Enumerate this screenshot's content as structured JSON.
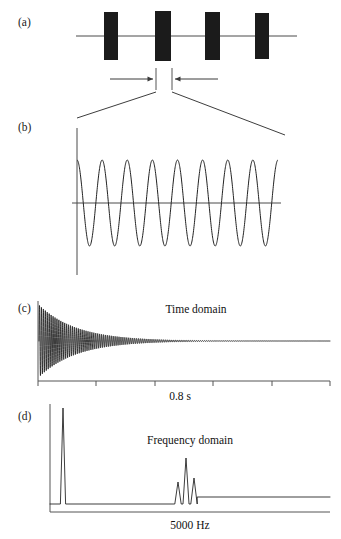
{
  "figure": {
    "caption_panels": [
      "(a)",
      "(b)",
      "(c)",
      "(d)"
    ],
    "label_a": "(a)",
    "label_b": "(b)",
    "label_c": "(c)",
    "label_d": "(d)",
    "background_color": "#ffffff",
    "ink_color": "#1a1a1a"
  },
  "panel_a": {
    "name": "pulse-train",
    "description": "Repeating dark pulse packets on a horizontal baseline",
    "baseline_y": 36,
    "baseline_x_start": 76,
    "baseline_x_end": 297,
    "pulse_color": "#1b1b1b",
    "pulses": [
      {
        "x": 104,
        "y": 12,
        "width": 14,
        "height": 48
      },
      {
        "x": 155,
        "y": 11,
        "width": 16,
        "height": 50
      },
      {
        "x": 205,
        "y": 12,
        "width": 15,
        "height": 48
      },
      {
        "x": 255,
        "y": 13,
        "width": 14,
        "height": 46
      }
    ],
    "markers": {
      "left_tick_x": 156,
      "right_tick_x": 172,
      "tick_top_y": 68,
      "tick_bottom_y": 90
    },
    "arrows": [
      {
        "from_x": 110,
        "to_x": 153,
        "y": 79,
        "direction": "right"
      },
      {
        "from_x": 218,
        "to_x": 175,
        "y": 79,
        "direction": "left"
      }
    ]
  },
  "expansion_leaders": {
    "name": "zoom-leader-lines",
    "left": {
      "x1": 156,
      "y1": 92,
      "x2": 77,
      "y2": 118
    },
    "right": {
      "x1": 172,
      "y1": 92,
      "x2": 285,
      "y2": 135
    }
  },
  "panel_b": {
    "name": "expanded-sine-burst",
    "description": "Expanded view of one pulse: continuous sinusoid",
    "axis_vertical_x": 77,
    "axis_vertical_y_top": 128,
    "axis_vertical_y_bottom": 275,
    "baseline_y": 203,
    "baseline_x_start": 72,
    "baseline_x_end": 281,
    "wave_x_start": 77,
    "wave_x_end": 278,
    "cycles": 8,
    "amplitude": 43,
    "peak_y": 160,
    "trough_y": 246
  },
  "panel_c": {
    "name": "time-domain-plot",
    "title": "Time domain",
    "title_x": 196,
    "title_y": 313,
    "axis_origin_x": 38,
    "axis_top_y": 301,
    "axis_bottom_y": 381,
    "axis_x_end": 330,
    "baseline_y": 341,
    "xaxis_label": "0.8 s",
    "xaxis_label_x": 180,
    "xaxis_label_y": 400,
    "tick_positions_x": [
      38,
      96,
      155,
      213,
      272,
      330
    ],
    "tick_length": 5,
    "signal": {
      "type": "damped-sinusoid",
      "start_x": 39,
      "end_x": 330,
      "initial_amplitude": 36,
      "decay_constant": 0.052,
      "oscillation_count": 150
    }
  },
  "panel_d": {
    "name": "frequency-domain-plot",
    "title": "Frequency domain",
    "title_x": 190,
    "title_y": 444,
    "axis_origin_x": 50,
    "axis_top_y": 404,
    "axis_bottom_y": 512,
    "axis_x_end": 330,
    "xaxis_label": "5000 Hz",
    "xaxis_label_x": 190,
    "xaxis_label_y": 529,
    "baseline_left_y": 504,
    "baseline_right_y": 497,
    "spectrum_start_x": 50,
    "spectrum_end_x": 330,
    "peaks": [
      {
        "name": "fundamental",
        "x": 63,
        "height": 96,
        "half_width": 2.6
      },
      {
        "name": "harmonic-left",
        "x": 178,
        "height": 22,
        "half_width": 3.2
      },
      {
        "name": "harmonic-center",
        "x": 186,
        "height": 46,
        "half_width": 3.0
      },
      {
        "name": "harmonic-right",
        "x": 194,
        "height": 26,
        "half_width": 3.2
      }
    ]
  }
}
